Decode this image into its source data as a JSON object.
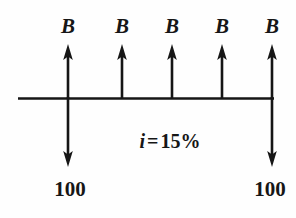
{
  "diagram": {
    "kind": "cash-flow-diagram",
    "colors": {
      "ink": "#161616",
      "background": "#fefefe"
    },
    "timeline": {
      "label": "time-axis",
      "x_start": 18,
      "x_end": 274,
      "y": 98,
      "stroke_width": 2.4
    },
    "interest": {
      "symbol": "i",
      "equals": "=",
      "value": "15%",
      "full_text": "i = 15%",
      "x": 170,
      "y": 131
    },
    "inflows": [
      {
        "label": "B",
        "x": 68,
        "label_y": 16,
        "tip_y": 45,
        "base_y": 99
      },
      {
        "label": "B",
        "x": 122,
        "label_y": 16,
        "tip_y": 45,
        "base_y": 99
      },
      {
        "label": "B",
        "x": 172,
        "label_y": 16,
        "tip_y": 45,
        "base_y": 99
      },
      {
        "label": "B",
        "x": 222,
        "label_y": 16,
        "tip_y": 45,
        "base_y": 99
      },
      {
        "label": "B",
        "x": 272,
        "label_y": 16,
        "tip_y": 45,
        "base_y": 99
      }
    ],
    "outflows": [
      {
        "label": "100",
        "x": 68,
        "label_y": 179,
        "top_y": 97,
        "tip_y": 166
      },
      {
        "label": "100",
        "x": 272,
        "label_y": 179,
        "top_y": 97,
        "tip_y": 166
      }
    ]
  }
}
